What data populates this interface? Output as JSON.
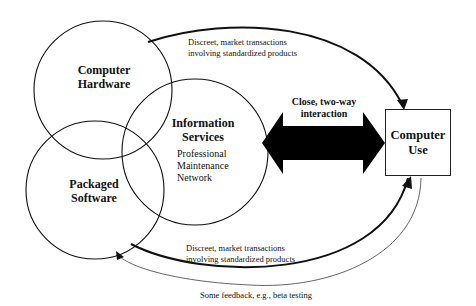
{
  "diagram": {
    "nodes": {
      "hardware": {
        "line1": "Computer",
        "line2": "Hardware"
      },
      "info_services": {
        "line1": "Information",
        "line2": "Services",
        "sub": [
          "Professional",
          "Maintenance",
          "Network"
        ]
      },
      "software": {
        "line1": "Packaged",
        "line2": "Software"
      },
      "computer_use": {
        "line1": "Computer",
        "line2": "Use"
      }
    },
    "edges": {
      "top_arc": {
        "line1": "Discreet, market transactions",
        "line2": "involving standardized products"
      },
      "bottom_arc": {
        "line1": "Discreet, market transactions",
        "line2": "involving standardized products"
      },
      "double_arrow": {
        "line1": "Close, two-way",
        "line2": "interaction"
      },
      "feedback": {
        "label": "Some feedback, e.g., beta testing"
      }
    },
    "colors": {
      "stroke": "#111111",
      "background": "#ffffff"
    }
  }
}
